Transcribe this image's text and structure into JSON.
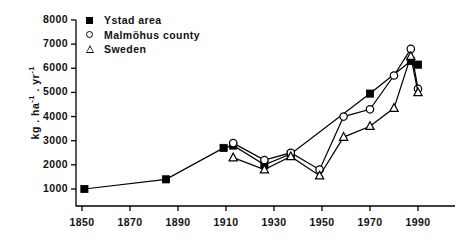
{
  "chart_data": {
    "type": "line",
    "title": "",
    "subtitle": "",
    "xlabel": "",
    "ylabel": "kg . ha-1 . yr-1",
    "xlim": [
      1845,
      1998
    ],
    "ylim": [
      0,
      8000
    ],
    "grid": false,
    "legend_position": "top-left",
    "x_ticks": [
      1850,
      1870,
      1890,
      1910,
      1930,
      1950,
      1970,
      1990
    ],
    "x_tick_labels": [
      "1850",
      "1870",
      "1890",
      "1910",
      "1930",
      "1950",
      "1970",
      "1990"
    ],
    "y_ticks": [
      1000,
      2000,
      3000,
      4000,
      5000,
      6000,
      7000,
      8000
    ],
    "y_tick_labels": [
      "1000",
      "2000",
      "3000",
      "4000",
      "5000",
      "6000",
      "7000",
      "8000"
    ],
    "series": [
      {
        "name": "Ystad area",
        "marker": "filled-square",
        "connected": true,
        "points": [
          {
            "x": 1851,
            "y": 1000
          },
          {
            "x": 1885,
            "y": 1400
          },
          {
            "x": 1909,
            "y": 2700
          },
          {
            "x": 1913,
            "y": 2800
          },
          {
            "x": 1926,
            "y": 2000
          },
          {
            "x": 1937,
            "y": 2450
          },
          {
            "x": 1970,
            "y": 4950
          },
          {
            "x": 1987,
            "y": 6300
          },
          {
            "x": 1990,
            "y": 6150
          }
        ]
      },
      {
        "name": "Malmöhus county",
        "marker": "open-circle",
        "connected": true,
        "points": [
          {
            "x": 1913,
            "y": 2900
          },
          {
            "x": 1926,
            "y": 2200
          },
          {
            "x": 1937,
            "y": 2500
          },
          {
            "x": 1949,
            "y": 1800
          },
          {
            "x": 1959,
            "y": 4000
          },
          {
            "x": 1970,
            "y": 4300
          },
          {
            "x": 1980,
            "y": 5700
          },
          {
            "x": 1987,
            "y": 6800
          },
          {
            "x": 1990,
            "y": 5150
          }
        ]
      },
      {
        "name": "Sweden",
        "marker": "open-triangle",
        "connected": true,
        "points": [
          {
            "x": 1913,
            "y": 2300
          },
          {
            "x": 1926,
            "y": 1800
          },
          {
            "x": 1937,
            "y": 2350
          },
          {
            "x": 1949,
            "y": 1550
          },
          {
            "x": 1959,
            "y": 3150
          },
          {
            "x": 1970,
            "y": 3600
          },
          {
            "x": 1980,
            "y": 4350
          },
          {
            "x": 1987,
            "y": 6500
          },
          {
            "x": 1990,
            "y": 5000
          }
        ]
      }
    ]
  },
  "legend": {
    "items": [
      {
        "label": "Ystad area",
        "marker": "filled-square"
      },
      {
        "label": "Malmöhus county",
        "marker": "open-circle"
      },
      {
        "label": "Sweden",
        "marker": "open-triangle"
      }
    ]
  },
  "axis": {
    "y_title_prefix": "kg . ha",
    "y_title_sup1": "-1",
    "y_title_mid": " . yr",
    "y_title_sup2": "-1"
  }
}
